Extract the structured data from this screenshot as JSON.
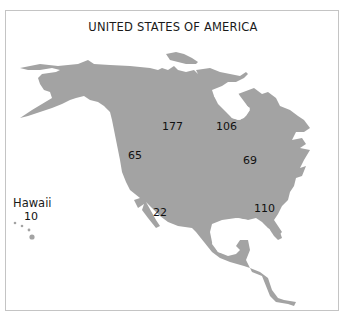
{
  "map": {
    "title": "UNITED STATES OF AMERICA",
    "fill_color": "#a3a3a3",
    "border_color": "#c4c4c4",
    "regions": [
      {
        "id": "northwest-central",
        "value": "177"
      },
      {
        "id": "northeast-central",
        "value": "106"
      },
      {
        "id": "west",
        "value": "65"
      },
      {
        "id": "east",
        "value": "69"
      },
      {
        "id": "southwest",
        "value": "22"
      },
      {
        "id": "southeast",
        "value": "110"
      }
    ],
    "inset": {
      "label": "Hawaii",
      "value": "10"
    }
  }
}
